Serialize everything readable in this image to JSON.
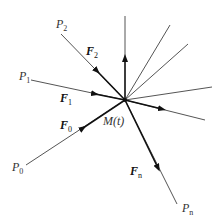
{
  "figure": {
    "center": {
      "x": 125,
      "y": 100,
      "label": "M(t)",
      "label_pos": {
        "x": 103,
        "y": 125
      }
    },
    "colors": {
      "line": "#555555",
      "force_line": "#111111",
      "label": "#333333",
      "background": "#ffffff"
    },
    "points": [
      {
        "id": "P0",
        "base": "P",
        "sub": "0",
        "x": 26,
        "y": 165,
        "label_pos": {
          "x": 12,
          "y": 171
        }
      },
      {
        "id": "P1",
        "base": "P",
        "sub": "1",
        "x": 31,
        "y": 80,
        "label_pos": {
          "x": 19,
          "y": 80
        }
      },
      {
        "id": "P2",
        "base": "P",
        "sub": "2",
        "x": 61,
        "y": 34,
        "label_pos": {
          "x": 56,
          "y": 28
        }
      },
      {
        "id": "Pn",
        "base": "P",
        "sub": "n",
        "x": 177,
        "y": 204,
        "label_pos": {
          "x": 182,
          "y": 212
        }
      }
    ],
    "forces": [
      {
        "id": "F0",
        "base": "F",
        "sub": "0",
        "label_pos": {
          "x": 60,
          "y": 129
        }
      },
      {
        "id": "F1",
        "base": "F",
        "sub": "1",
        "label_pos": {
          "x": 60,
          "y": 102
        }
      },
      {
        "id": "F2",
        "base": "F",
        "sub": "2",
        "label_pos": {
          "x": 86,
          "y": 55
        }
      },
      {
        "id": "Fn",
        "base": "F",
        "sub": "n",
        "label_pos": {
          "x": 130,
          "y": 175
        }
      }
    ],
    "rays": [
      {
        "x2": 125,
        "y2": 16,
        "arrow": true
      },
      {
        "x2": 170,
        "y2": 25,
        "arrow": false
      },
      {
        "x2": 188,
        "y2": 44,
        "arrow": false
      },
      {
        "x2": 212,
        "y2": 87,
        "arrow": false
      },
      {
        "x2": 205,
        "y2": 120,
        "arrow": true
      }
    ]
  }
}
